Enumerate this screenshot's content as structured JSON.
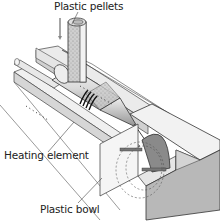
{
  "diagram": {
    "labels": {
      "pellets": "Plastic pellets",
      "heating": "Heating element",
      "bowl": "Plastic bowl"
    },
    "colors": {
      "line": "#333333",
      "light_fill": "#eeeeee",
      "mid_fill": "#d8d8d8",
      "dark_fill": "#aaaaaa",
      "mould_cavity": "#8a8a8a"
    }
  }
}
